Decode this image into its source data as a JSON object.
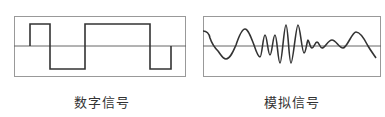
{
  "panels": [
    {
      "id": "digital",
      "caption": "数字信号",
      "signal_type": "digital",
      "waveform_levels": [
        "zero",
        "high",
        "low",
        "high",
        "low",
        "zero"
      ],
      "segment_widths": [
        0.094,
        0.116,
        0.203,
        0.378,
        0.122,
        0.0
      ]
    },
    {
      "id": "analog",
      "caption": "模拟信号",
      "signal_type": "analog"
    }
  ],
  "colors": {
    "border": "#888888",
    "axis": "#666666",
    "signal": "#333333"
  }
}
